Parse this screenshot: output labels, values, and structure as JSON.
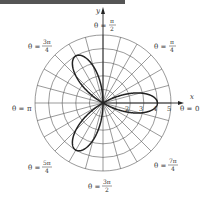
{
  "chart_data": {
    "type": "line",
    "subtype": "polar",
    "title": "",
    "equation": "r = 4cos(3θ)",
    "series": [
      {
        "name": "rose curve",
        "petals": 3,
        "amplitude": 4,
        "petal_angles": [
          "0",
          "2π/3",
          "4π/3"
        ],
        "color": "#222222"
      }
    ],
    "xlabel": "x",
    "ylabel": "y",
    "radial_ticks": [
      "2",
      "3",
      "4",
      "5"
    ],
    "rlim": [
      0,
      5
    ],
    "grid": {
      "circles": 5,
      "radial_step_deg": 15
    },
    "angle_labels": [
      {
        "id": "theta-0",
        "prefix": "θ = ",
        "num": "0",
        "den": ""
      },
      {
        "id": "theta-pi-4",
        "prefix": "θ = ",
        "num": "π",
        "den": "4"
      },
      {
        "id": "theta-pi-2",
        "prefix": "θ = ",
        "num": "π",
        "den": "2"
      },
      {
        "id": "theta-3pi-4",
        "prefix": "θ = ",
        "num": "3π",
        "den": "4"
      },
      {
        "id": "theta-pi",
        "prefix": "θ = ",
        "num": "π",
        "den": ""
      },
      {
        "id": "theta-5pi-4",
        "prefix": "θ = ",
        "num": "5π",
        "den": "4"
      },
      {
        "id": "theta-3pi-2",
        "prefix": "θ = ",
        "num": "3π",
        "den": "2"
      },
      {
        "id": "theta-7pi-4",
        "prefix": "θ = ",
        "num": "7π",
        "den": "4"
      }
    ]
  },
  "labels": {
    "x_axis": "x",
    "y_axis": "y",
    "theta_eq": "θ =",
    "pi": "π",
    "three_pi": "3π",
    "five_pi": "5π",
    "seven_pi": "7π",
    "two": "2",
    "four": "4",
    "zero": "0",
    "tick_2": "2",
    "tick_3": "3",
    "tick_4": "4",
    "tick_5": "5"
  },
  "colors": {
    "grid": "#555555",
    "curve": "#222222",
    "axes": "#222222"
  }
}
